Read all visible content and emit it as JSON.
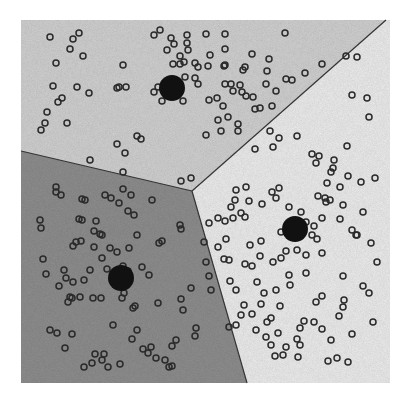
{
  "diagram": {
    "type": "voronoi-kmeans-clusters",
    "canvas": {
      "width": 408,
      "height": 400
    },
    "plot_area": {
      "x0": 21,
      "y0": 20,
      "x1": 390,
      "y1": 383
    },
    "colors": {
      "region_top": "#d2d2d2",
      "region_left": "#8f8f8f",
      "region_right": "#eeeeee",
      "boundary": "#333333",
      "point_stroke": "#2a2a2a",
      "point_fill": "none",
      "centroid": "#111111"
    },
    "junction": [
      192,
      191
    ],
    "boundaries": [
      {
        "name": "top-left",
        "from": [
          21,
          151
        ],
        "to": [
          192,
          191
        ]
      },
      {
        "name": "top-right",
        "from": [
          192,
          191
        ],
        "to": [
          386,
          20
        ]
      },
      {
        "name": "left-right",
        "from": [
          192,
          191
        ],
        "to": [
          247,
          383
        ]
      }
    ],
    "regions": [
      {
        "name": "top",
        "polygon": [
          [
            21,
            20
          ],
          [
            386,
            20
          ],
          [
            192,
            191
          ],
          [
            21,
            151
          ]
        ]
      },
      {
        "name": "left",
        "polygon": [
          [
            21,
            151
          ],
          [
            192,
            191
          ],
          [
            247,
            383
          ],
          [
            21,
            383
          ]
        ]
      },
      {
        "name": "right",
        "polygon": [
          [
            386,
            20
          ],
          [
            390,
            20
          ],
          [
            390,
            383
          ],
          [
            247,
            383
          ],
          [
            192,
            191
          ]
        ]
      }
    ],
    "centroids": [
      {
        "cluster": "top",
        "x": 172,
        "y": 88,
        "r": 13
      },
      {
        "cluster": "right",
        "x": 295,
        "y": 229,
        "r": 13
      },
      {
        "cluster": "left",
        "x": 121,
        "y": 278,
        "r": 13
      }
    ],
    "points": [
      [
        50,
        37
      ],
      [
        79,
        33
      ],
      [
        73,
        39
      ],
      [
        70,
        49
      ],
      [
        83,
        56
      ],
      [
        56,
        63
      ],
      [
        123,
        65
      ],
      [
        53,
        86
      ],
      [
        77,
        87
      ],
      [
        89,
        93
      ],
      [
        117,
        88
      ],
      [
        119,
        87
      ],
      [
        126,
        87
      ],
      [
        62,
        98
      ],
      [
        58,
        102
      ],
      [
        47,
        112
      ],
      [
        45,
        123
      ],
      [
        41,
        130
      ],
      [
        67,
        123
      ],
      [
        137,
        136
      ],
      [
        141,
        139
      ],
      [
        117,
        144
      ],
      [
        125,
        153
      ],
      [
        90,
        160
      ],
      [
        123,
        172
      ],
      [
        181,
        181
      ],
      [
        191,
        178
      ],
      [
        154,
        35
      ],
      [
        160,
        30
      ],
      [
        171,
        38
      ],
      [
        167,
        50
      ],
      [
        158,
        87
      ],
      [
        167,
        85
      ],
      [
        187,
        35
      ],
      [
        187,
        43
      ],
      [
        188,
        50
      ],
      [
        180,
        64
      ],
      [
        180,
        56
      ],
      [
        173,
        64
      ],
      [
        174,
        44
      ],
      [
        184,
        62
      ],
      [
        195,
        63
      ],
      [
        198,
        67
      ],
      [
        208,
        66
      ],
      [
        195,
        78
      ],
      [
        198,
        84
      ],
      [
        183,
        101
      ],
      [
        162,
        101
      ],
      [
        154,
        92
      ],
      [
        185,
        77
      ],
      [
        223,
        106
      ],
      [
        225,
        34
      ],
      [
        225,
        49
      ],
      [
        225,
        65
      ],
      [
        225,
        84
      ],
      [
        245,
        67
      ],
      [
        240,
        85
      ],
      [
        242,
        92
      ],
      [
        246,
        96
      ],
      [
        255,
        109
      ],
      [
        238,
        124
      ],
      [
        221,
        131
      ],
      [
        206,
        135
      ],
      [
        228,
        117
      ],
      [
        260,
        108
      ],
      [
        285,
        33
      ],
      [
        217,
        98
      ],
      [
        218,
        120
      ],
      [
        238,
        131
      ],
      [
        206,
        34
      ],
      [
        210,
        55
      ],
      [
        224,
        66
      ],
      [
        231,
        84
      ],
      [
        252,
        54
      ],
      [
        269,
        59
      ],
      [
        267,
        71
      ],
      [
        266,
        84
      ],
      [
        243,
        70
      ],
      [
        276,
        91
      ],
      [
        286,
        79
      ],
      [
        292,
        80
      ],
      [
        305,
        73
      ],
      [
        322,
        64
      ],
      [
        346,
        56
      ],
      [
        357,
        57
      ],
      [
        272,
        106
      ],
      [
        270,
        131
      ],
      [
        273,
        147
      ],
      [
        255,
        149
      ],
      [
        352,
        95
      ],
      [
        367,
        98
      ],
      [
        369,
        117
      ],
      [
        279,
        138
      ],
      [
        297,
        136
      ],
      [
        312,
        154
      ],
      [
        334,
        160
      ],
      [
        347,
        146
      ],
      [
        348,
        176
      ],
      [
        343,
        205
      ],
      [
        253,
        97
      ],
      [
        209,
        100
      ],
      [
        233,
        91
      ],
      [
        56,
        192
      ],
      [
        61,
        195
      ],
      [
        82,
        199
      ],
      [
        85,
        200
      ],
      [
        79,
        219
      ],
      [
        82,
        220
      ],
      [
        96,
        221
      ],
      [
        102,
        235
      ],
      [
        76,
        242
      ],
      [
        73,
        246
      ],
      [
        81,
        241
      ],
      [
        56,
        187
      ],
      [
        105,
        195
      ],
      [
        111,
        198
      ],
      [
        152,
        200
      ],
      [
        128,
        211
      ],
      [
        134,
        215
      ],
      [
        100,
        234
      ],
      [
        94,
        231
      ],
      [
        119,
        203
      ],
      [
        123,
        189
      ],
      [
        131,
        195
      ],
      [
        129,
        248
      ],
      [
        102,
        258
      ],
      [
        137,
        235
      ],
      [
        117,
        252
      ],
      [
        123,
        266
      ],
      [
        94,
        247
      ],
      [
        110,
        248
      ],
      [
        40,
        220
      ],
      [
        41,
        228
      ],
      [
        43,
        259
      ],
      [
        46,
        274
      ],
      [
        66,
        278
      ],
      [
        90,
        270
      ],
      [
        73,
        282
      ],
      [
        159,
        243
      ],
      [
        162,
        241
      ],
      [
        180,
        225
      ],
      [
        181,
        229
      ],
      [
        181,
        299
      ],
      [
        191,
        288
      ],
      [
        183,
        310
      ],
      [
        196,
        328
      ],
      [
        195,
        336
      ],
      [
        59,
        286
      ],
      [
        70,
        297
      ],
      [
        68,
        302
      ],
      [
        93,
        298
      ],
      [
        101,
        298
      ],
      [
        72,
        298
      ],
      [
        80,
        297
      ],
      [
        64,
        270
      ],
      [
        84,
        280
      ],
      [
        122,
        298
      ],
      [
        124,
        293
      ],
      [
        107,
        269
      ],
      [
        128,
        271
      ],
      [
        142,
        267
      ],
      [
        149,
        275
      ],
      [
        135,
        306
      ],
      [
        133,
        308
      ],
      [
        158,
        303
      ],
      [
        172,
        346
      ],
      [
        176,
        340
      ],
      [
        137,
        330
      ],
      [
        151,
        347
      ],
      [
        156,
        358
      ],
      [
        143,
        349
      ],
      [
        113,
        325
      ],
      [
        132,
        339
      ],
      [
        165,
        360
      ],
      [
        102,
        360
      ],
      [
        104,
        354
      ],
      [
        95,
        354
      ],
      [
        92,
        363
      ],
      [
        120,
        364
      ],
      [
        108,
        367
      ],
      [
        50,
        330
      ],
      [
        57,
        333
      ],
      [
        72,
        334
      ],
      [
        65,
        348
      ],
      [
        84,
        367
      ],
      [
        169,
        367
      ],
      [
        172,
        366
      ],
      [
        148,
        353
      ],
      [
        209,
        223
      ],
      [
        218,
        218
      ],
      [
        225,
        221
      ],
      [
        233,
        218
      ],
      [
        204,
        242
      ],
      [
        218,
        247
      ],
      [
        224,
        259
      ],
      [
        229,
        260
      ],
      [
        252,
        266
      ],
      [
        245,
        264
      ],
      [
        209,
        276
      ],
      [
        206,
        262
      ],
      [
        211,
        290
      ],
      [
        230,
        281
      ],
      [
        236,
        290
      ],
      [
        257,
        282
      ],
      [
        244,
        305
      ],
      [
        261,
        304
      ],
      [
        241,
        315
      ],
      [
        229,
        327
      ],
      [
        236,
        325
      ],
      [
        252,
        314
      ],
      [
        256,
        330
      ],
      [
        267,
        322
      ],
      [
        280,
        306
      ],
      [
        306,
        273
      ],
      [
        316,
        302
      ],
      [
        322,
        296
      ],
      [
        304,
        321
      ],
      [
        300,
        345
      ],
      [
        300,
        328
      ],
      [
        286,
        347
      ],
      [
        283,
        355
      ],
      [
        275,
        356
      ],
      [
        298,
        357
      ],
      [
        271,
        345
      ],
      [
        266,
        337
      ],
      [
        297,
        339
      ],
      [
        278,
        333
      ],
      [
        290,
        285
      ],
      [
        289,
        275
      ],
      [
        260,
        256
      ],
      [
        273,
        262
      ],
      [
        250,
        245
      ],
      [
        261,
        241
      ],
      [
        289,
        207
      ],
      [
        301,
        212
      ],
      [
        297,
        250
      ],
      [
        306,
        255
      ],
      [
        281,
        258
      ],
      [
        322,
        253
      ],
      [
        286,
        251
      ],
      [
        281,
        232
      ],
      [
        314,
        226
      ],
      [
        306,
        222
      ],
      [
        318,
        196
      ],
      [
        325,
        198
      ],
      [
        330,
        200
      ],
      [
        326,
        202
      ],
      [
        322,
        218
      ],
      [
        312,
        235
      ],
      [
        317,
        239
      ],
      [
        316,
        163
      ],
      [
        319,
        156
      ],
      [
        327,
        183
      ],
      [
        331,
        172
      ],
      [
        333,
        168
      ],
      [
        340,
        187
      ],
      [
        340,
        219
      ],
      [
        352,
        230
      ],
      [
        357,
        235
      ],
      [
        375,
        178
      ],
      [
        361,
        182
      ],
      [
        363,
        212
      ],
      [
        356,
        235
      ],
      [
        343,
        276
      ],
      [
        371,
        243
      ],
      [
        377,
        262
      ],
      [
        344,
        300
      ],
      [
        363,
        286
      ],
      [
        352,
        334
      ],
      [
        331,
        340
      ],
      [
        373,
        322
      ],
      [
        369,
        293
      ],
      [
        276,
        198
      ],
      [
        272,
        192
      ],
      [
        279,
        188
      ],
      [
        262,
        204
      ],
      [
        246,
        187
      ],
      [
        236,
        190
      ],
      [
        235,
        200
      ],
      [
        249,
        201
      ],
      [
        231,
        207
      ],
      [
        241,
        213
      ],
      [
        245,
        217
      ],
      [
        226,
        239
      ],
      [
        264,
        293
      ],
      [
        276,
        290
      ],
      [
        314,
        322
      ],
      [
        322,
        329
      ],
      [
        339,
        316
      ],
      [
        343,
        307
      ],
      [
        348,
        362
      ],
      [
        328,
        361
      ],
      [
        337,
        358
      ],
      [
        271,
        318
      ]
    ],
    "point_radius": 3
  }
}
